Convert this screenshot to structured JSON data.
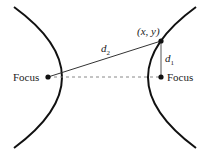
{
  "diagram": {
    "type": "hyperbola-foci",
    "labels": {
      "left_focus": "Focus",
      "right_focus": "Focus",
      "point": "(x, y)",
      "d1": "d",
      "d1_sub": "1",
      "d2": "d",
      "d2_sub": "2"
    },
    "colors": {
      "curve": "#111111",
      "line": "#333333",
      "dashed": "#888888",
      "text": "#222222"
    }
  }
}
